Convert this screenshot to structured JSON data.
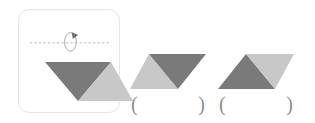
{
  "page": {
    "background_color": "#ffffff",
    "width": 315,
    "height": 123
  },
  "colors": {
    "dark_triangle": "#7a7a7a",
    "light_triangle": "#c8c8c8",
    "panel_border": "#e6e6e6",
    "axis_line": "#b9b9b9",
    "rotation_arrow": "#9a9a9a",
    "paren_text": "#8d8d8d"
  },
  "figure_panel": {
    "name": "original-figure-panel",
    "axis": {
      "style": "dashed",
      "orientation": "horizontal",
      "label": "axis-of-rotation"
    },
    "rotation_marker": {
      "label": "rotation-arrow",
      "direction": "clockwise-about-horizontal-axis"
    },
    "shape": {
      "label": "original-shape",
      "description": "parallelogram formed by a dark triangle pointing down on the left and a light triangle on the right",
      "left_triangle_color": "#7a7a7a",
      "right_triangle_color": "#c8c8c8"
    }
  },
  "options": [
    {
      "id": "option-1",
      "shape_label": "candidate-shape-1",
      "description": "horizontal mirror image: light triangle on the left, dark triangle pointing down on the right",
      "left_triangle_color": "#c8c8c8",
      "right_triangle_color": "#7a7a7a",
      "answer": {
        "open_paren": "(",
        "value": "",
        "close_paren": ")"
      }
    },
    {
      "id": "option-2",
      "shape_label": "candidate-shape-2",
      "description": "vertical flip: dark triangle pointing up on the left, light triangle on the right",
      "left_triangle_color": "#7a7a7a",
      "right_triangle_color": "#c8c8c8",
      "answer": {
        "open_paren": "(",
        "value": "",
        "close_paren": ")"
      }
    }
  ]
}
